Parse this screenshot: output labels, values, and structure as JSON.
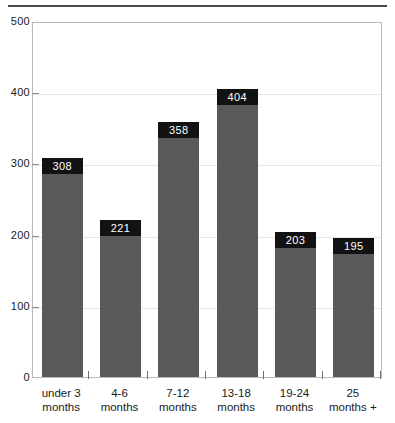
{
  "chart_data": {
    "type": "bar",
    "title": "",
    "subtitle": "",
    "xlabel": "",
    "ylabel": "",
    "categories": [
      "under 3 months",
      "4-6 months",
      "7-12 months",
      "13-18 months",
      "19-24 months",
      "25 months +"
    ],
    "category_lines": [
      [
        "under 3",
        "months"
      ],
      [
        "4-6",
        "months"
      ],
      [
        "7-12",
        "months"
      ],
      [
        "13-18",
        "months"
      ],
      [
        "19-24",
        "months"
      ],
      [
        "25",
        "months +"
      ]
    ],
    "values": [
      308,
      221,
      358,
      404,
      203,
      195
    ],
    "value_labels": [
      "308",
      "221",
      "358",
      "404",
      "203",
      "195"
    ],
    "ylim": [
      0,
      500
    ],
    "yticks": [
      0,
      100,
      200,
      300,
      400,
      500
    ],
    "ytick_labels": [
      "0",
      "100",
      "200",
      "300",
      "400",
      "500"
    ],
    "grid": true,
    "legend": null,
    "colors": {
      "bar_fill": "#595959",
      "value_box_fill": "#121212",
      "value_box_text": "#ffffff",
      "gridline": "#e6e6e6",
      "plot_border": "#b9b9b9",
      "top_rule": "#4a4a4a",
      "text": "#1a1a1a",
      "background": "#ffffff"
    }
  }
}
